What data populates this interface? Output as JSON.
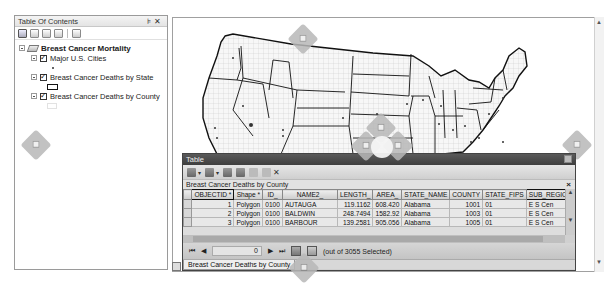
{
  "toc": {
    "title": "Table Of Contents",
    "controls": "↕ ×",
    "toolbar": [
      "list-by-drawing-order",
      "list-by-source",
      "list-by-visibility",
      "list-by-selection",
      "options"
    ],
    "data_frame": "Breast Cancer Mortality",
    "layers": [
      {
        "label": "Major U.S. Cities",
        "checked": true,
        "symbol": "point"
      },
      {
        "label": "Breast Cancer Deaths by State",
        "checked": true,
        "symbol": "polygon-outline"
      },
      {
        "label": "Breast Cancer Deaths by County",
        "checked": true,
        "symbol": "polygon-light"
      }
    ]
  },
  "table_window": {
    "title": "Table",
    "layer_title": "Breast Cancer Deaths by County",
    "close_label": "×",
    "columns": [
      "OBJECTID *",
      "Shape *",
      "ID_",
      "NAME2_",
      "LENGTH_",
      "AREA_",
      "STATE_NAME",
      "COUNTY",
      "STATE_FIPS",
      "SUB_REGION"
    ],
    "rows": [
      [
        "1",
        "Polygon",
        "0100",
        "AUTAUGA",
        "119.1162",
        "608.420",
        "Alabama",
        "1001",
        "01",
        "E S Cen"
      ],
      [
        "2",
        "Polygon",
        "0100",
        "BALDWIN",
        "248.7494",
        "1582.92",
        "Alabama",
        "1003",
        "01",
        "E S Cen"
      ],
      [
        "3",
        "Polygon",
        "0100",
        "BARBOUR",
        "139.2581",
        "905.056",
        "Alabama",
        "1005",
        "01",
        "E S Cen"
      ]
    ],
    "navigation": {
      "first": "⏮",
      "prev": "◀",
      "current_record": "0",
      "next": "▶",
      "last": "⏭",
      "selection_status": "(out of 3055 Selected)"
    },
    "tabs": [
      "Breast Cancer Deaths by County"
    ]
  },
  "map": {
    "description": "Map of contiguous United States with state and county boundaries and city points"
  }
}
